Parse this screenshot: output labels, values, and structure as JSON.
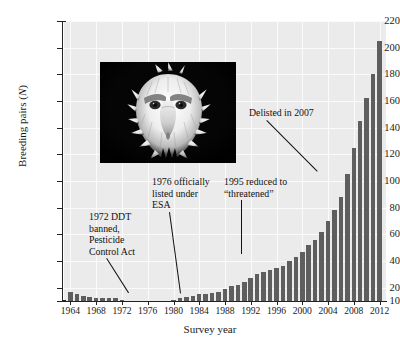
{
  "chart_data": {
    "type": "bar",
    "title": "",
    "subtitle": "",
    "xlabel": "Survey year",
    "ylabel": "Breeding pairs (N)",
    "ylabel_plain": "Breeding pairs",
    "ylabel_italic": "N",
    "ylim": [
      10,
      220
    ],
    "ytick_step": 20,
    "yticks": [
      10,
      20,
      40,
      60,
      80,
      100,
      120,
      140,
      160,
      180,
      200,
      220
    ],
    "ytick_labels": [
      "10",
      "20",
      "40",
      "60",
      "80",
      "100",
      "120",
      "140",
      "160",
      "180",
      "200",
      "220"
    ],
    "xlim": [
      1963,
      2013
    ],
    "xticks": [
      1964,
      1968,
      1972,
      1976,
      1980,
      1984,
      1988,
      1992,
      1996,
      2000,
      2004,
      2008,
      2012
    ],
    "xtick_labels": [
      "1964",
      "1968",
      "1972",
      "1976",
      "1980",
      "1984",
      "1988",
      "1992",
      "1996",
      "2000",
      "2004",
      "2008",
      "2012"
    ],
    "grid": true,
    "legend": "none",
    "bar_color": "#5e5e5e",
    "plot_background": "#ebebeb",
    "gridline_color": "#fbfbfb",
    "categories": [
      1964,
      1965,
      1966,
      1967,
      1968,
      1969,
      1970,
      1971,
      1972,
      1973,
      1974,
      1975,
      1976,
      1977,
      1978,
      1979,
      1980,
      1981,
      1982,
      1983,
      1984,
      1985,
      1986,
      1987,
      1988,
      1989,
      1990,
      1991,
      1992,
      1993,
      1994,
      1995,
      1996,
      1997,
      1998,
      1999,
      2000,
      2001,
      2002,
      2003,
      2004,
      2005,
      2006,
      2007,
      2008,
      2009,
      2010,
      2011,
      2012
    ],
    "values": [
      17,
      15,
      14,
      13,
      12,
      12,
      12,
      12,
      11,
      10,
      10,
      10,
      10,
      10,
      10,
      10,
      11,
      12,
      13,
      14,
      15,
      15,
      16,
      17,
      19,
      21,
      22,
      24,
      27,
      30,
      32,
      33,
      35,
      36,
      40,
      43,
      47,
      52,
      56,
      62,
      70,
      78,
      88,
      105,
      125,
      145,
      162,
      180,
      205
    ]
  },
  "annotations": [
    {
      "name": "annotation-ddt",
      "text": "1972 DDT banned, Pesticide Control Act",
      "lines": [
        "1972 DDT",
        "banned,",
        "Pesticide",
        "Control Act"
      ],
      "target_year": 1973
    },
    {
      "name": "annotation-esa",
      "text": "1976 officially listed under ESA",
      "lines": [
        "1976 officially",
        "listed under",
        "ESA"
      ],
      "target_year": 1977
    },
    {
      "name": "annotation-threatened",
      "text": "1995 reduced to “threatened”",
      "lines": [
        "1995 reduced to",
        "“threatened”"
      ],
      "target_year": 1996
    },
    {
      "name": "annotation-delisted",
      "text": "Delisted in 2007",
      "lines": [
        "Delisted in 2007"
      ],
      "target_year": 2007
    }
  ],
  "photo": {
    "name": "bald-eagle-photograph",
    "alt": "Photograph of a bald eagle head, white head and dark background",
    "background_color": "#050505"
  }
}
